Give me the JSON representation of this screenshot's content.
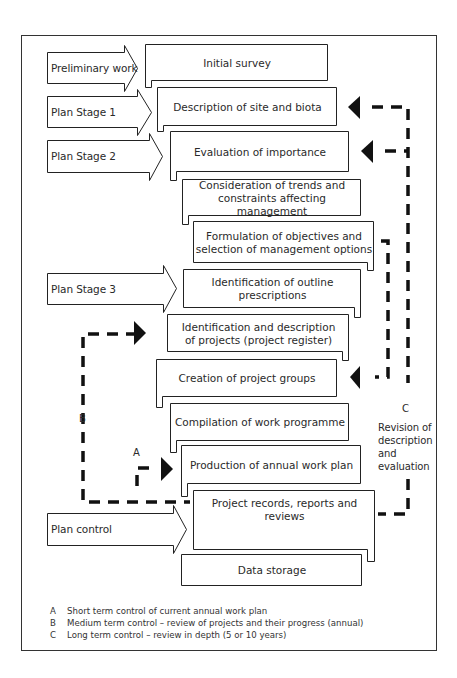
{
  "diagram": {
    "stages": [
      {
        "label": "Preliminary work"
      },
      {
        "label": "Plan Stage 1"
      },
      {
        "label": "Plan Stage 2"
      },
      {
        "label": "Plan Stage 3"
      },
      {
        "label": "Plan control"
      }
    ],
    "steps": [
      {
        "text": "Initial survey"
      },
      {
        "text": "Description of site and biota"
      },
      {
        "text": "Evaluation of importance"
      },
      {
        "line1": "Consideration of trends and",
        "line2": "constraints affecting management"
      },
      {
        "line1": "Formulation of objectives and",
        "line2": "selection of management options"
      },
      {
        "text": "Identification of outline prescriptions"
      },
      {
        "line1": "Identification and description",
        "line2": "of projects (project register)"
      },
      {
        "text": "Creation of project groups"
      },
      {
        "text": "Compilation of work programme"
      },
      {
        "text": "Production of annual work plan"
      },
      {
        "text": "Project records, reports and reviews"
      },
      {
        "text": "Data storage"
      }
    ],
    "loops": {
      "a": {
        "label": "A"
      },
      "b": {
        "label": "B"
      },
      "c": {
        "label": "C",
        "note_lines": [
          "Revision of",
          "description",
          "and",
          "evaluation"
        ]
      }
    },
    "legend": [
      {
        "key": "A",
        "text": "Short term control of current annual work plan"
      },
      {
        "key": "B",
        "text": "Medium term control – review of projects and their progress (annual)"
      },
      {
        "key": "C",
        "text": "Long term control – review in depth (5 or 10 years)"
      }
    ],
    "colors": {
      "line": "#222222",
      "dash": "#111111",
      "background": "#ffffff"
    }
  }
}
